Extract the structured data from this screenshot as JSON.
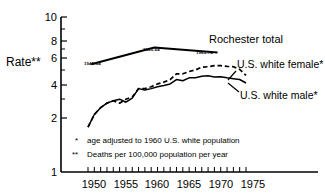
{
  "chart_data": {
    "type": "line",
    "title": "",
    "xlabel": "",
    "ylabel": "Rate**",
    "yscale": "log",
    "ylim": [
      1,
      10
    ],
    "xlim": [
      1947.5,
      1977
    ],
    "grid": false,
    "legend_position": "inline-right",
    "ytick_labels": [
      "10",
      "8",
      "6",
      "4",
      "2",
      "1"
    ],
    "ytick_values": [
      10,
      8,
      6,
      4,
      2,
      1
    ],
    "yminor_values": [
      9,
      7,
      5,
      3
    ],
    "xtick_labels": [
      "1950",
      "1955",
      "1960",
      "1965",
      "1970",
      "1975"
    ],
    "xtick_values": [
      1950,
      1955,
      1960,
      1965,
      1970,
      1975
    ],
    "xminor_range": [
      1949,
      1974
    ],
    "series": [
      {
        "name": "Rochester total",
        "style": "solid-thick",
        "label": "Rochester total",
        "segment_labels": [
          "1945-54",
          "1955-64",
          "1965-74"
        ],
        "x": [
          1949.5,
          1959.5,
          1969.5
        ],
        "values": [
          4.95,
          6.35,
          5.9
        ]
      },
      {
        "name": "U.S. white female*",
        "style": "dashed",
        "label": "U.S. white female*",
        "x": [
          1949,
          1950,
          1951,
          1952,
          1953,
          1954,
          1955,
          1956,
          1957,
          1958,
          1959,
          1960,
          1961,
          1962,
          1963,
          1964,
          1965,
          1966,
          1967,
          1968,
          1969,
          1970,
          1971,
          1972,
          1973,
          1974
        ],
        "values": [
          1.95,
          2.35,
          2.6,
          2.78,
          2.88,
          2.78,
          2.95,
          3.05,
          3.45,
          3.45,
          3.55,
          3.7,
          3.8,
          3.95,
          4.3,
          4.3,
          4.45,
          4.55,
          4.75,
          4.78,
          4.85,
          4.85,
          4.8,
          4.78,
          4.6,
          4.2
        ]
      },
      {
        "name": "U.S. white male*",
        "style": "solid",
        "label": "U.S. white male*",
        "x": [
          1949,
          1950,
          1951,
          1952,
          1953,
          1954,
          1955,
          1956,
          1957,
          1958,
          1959,
          1960,
          1961,
          1962,
          1963,
          1964,
          1965,
          1966,
          1967,
          1968,
          1969,
          1970,
          1971,
          1972,
          1973,
          1974
        ],
        "values": [
          1.95,
          2.35,
          2.6,
          2.78,
          2.88,
          2.95,
          2.82,
          3.0,
          3.45,
          3.38,
          3.45,
          3.55,
          3.62,
          3.7,
          3.95,
          3.88,
          4.05,
          4.05,
          4.15,
          4.18,
          4.1,
          4.12,
          4.05,
          4.0,
          3.95,
          3.75
        ]
      }
    ],
    "annotations": [
      {
        "name": "footnote-single-star",
        "marker": "*",
        "text": "age adjusted to 1960 U.S. white population"
      },
      {
        "name": "footnote-double-star",
        "marker": "**",
        "text": "Deaths per 100,000 population per year"
      }
    ]
  }
}
